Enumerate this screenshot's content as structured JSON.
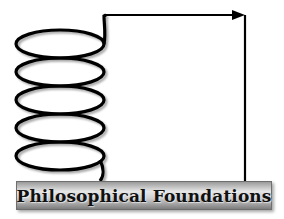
{
  "diagram": {
    "title": "Philosophical Foundations",
    "elements": {
      "coil": {
        "turns": 5,
        "icon": "spring-coil-icon"
      },
      "connector": {
        "icon": "arrow-right-icon"
      }
    },
    "colors": {
      "stroke": "#000000",
      "banner_light": "#e6e6e6",
      "banner_dark": "#7d7d7d",
      "text": "#111111"
    }
  }
}
